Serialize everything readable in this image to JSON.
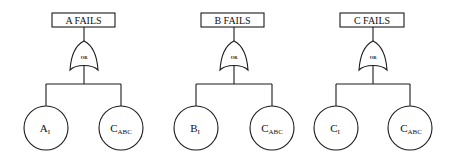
{
  "diagram": {
    "type": "fault-tree",
    "stroke_color": "#1a1a1a",
    "background_color": "#ffffff",
    "trees": [
      {
        "top_event": "A FAILS",
        "gate": "OR",
        "basic_events": [
          {
            "main": "A",
            "sub": "I"
          },
          {
            "main": "C",
            "sub": "ABC"
          }
        ]
      },
      {
        "top_event": "B FAILS",
        "gate": "OR",
        "basic_events": [
          {
            "main": "B",
            "sub": "I"
          },
          {
            "main": "C",
            "sub": "ABC"
          }
        ]
      },
      {
        "top_event": "C FAILS",
        "gate": "OR",
        "basic_events": [
          {
            "main": "C",
            "sub": "I"
          },
          {
            "main": "C",
            "sub": "ABC"
          }
        ]
      }
    ]
  }
}
